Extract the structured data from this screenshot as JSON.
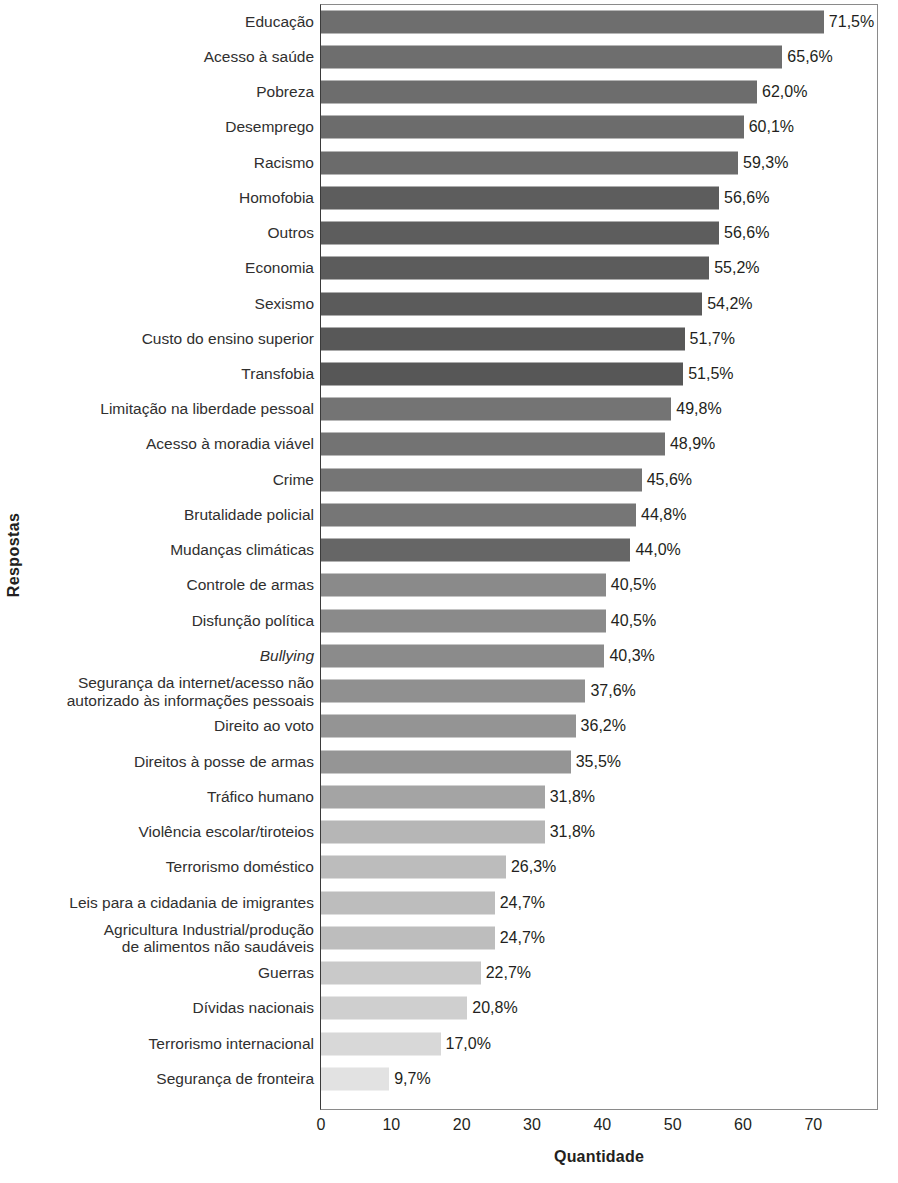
{
  "chart_data": {
    "type": "bar",
    "orientation": "horizontal",
    "title": "",
    "xlabel": "Quantidade",
    "ylabel": "Respostas",
    "xlim": [
      0,
      79.2
    ],
    "xticks": [
      0,
      10,
      20,
      30,
      40,
      50,
      60,
      70
    ],
    "grid": false,
    "legend": null,
    "value_suffix": "%",
    "decimal_separator": ",",
    "categories": [
      "Educação",
      "Acesso à saúde",
      "Pobreza",
      "Desemprego",
      "Racismo",
      "Homofobia",
      "Outros",
      "Economia",
      "Sexismo",
      "Custo do ensino superior",
      "Transfobia",
      "Limitação na liberdade pessoal",
      "Acesso à moradia viável",
      "Crime",
      "Brutalidade policial",
      "Mudanças climáticas",
      "Controle de armas",
      "Disfunção política",
      "Bullying",
      "Segurança da internet/acesso não\nautorizado às informações pessoais",
      "Direito ao voto",
      "Direitos à posse de armas",
      "Tráfico humano",
      "Violência escolar/tiroteios",
      "Terrorismo doméstico",
      "Leis para a cidadania de imigrantes",
      "Agricultura Industrial/produção\nde alimentos não saudáveis",
      "Guerras",
      "Dívidas nacionais",
      "Terrorismo internacional",
      "Segurança de fronteira"
    ],
    "values": [
      71.5,
      65.6,
      62.0,
      60.1,
      59.3,
      56.6,
      56.6,
      55.2,
      54.2,
      51.7,
      51.5,
      49.8,
      48.9,
      45.6,
      44.8,
      44.0,
      40.5,
      40.5,
      40.3,
      37.6,
      36.2,
      35.5,
      31.8,
      31.8,
      26.3,
      24.7,
      24.7,
      22.7,
      20.8,
      17.0,
      9.7
    ],
    "value_labels": [
      "71,5%",
      "65,6%",
      "62,0%",
      "60,1%",
      "59,3%",
      "56,6%",
      "56,6%",
      "55,2%",
      "54,2%",
      "51,7%",
      "51,5%",
      "49,8%",
      "48,9%",
      "45,6%",
      "44,8%",
      "44,0%",
      "40,5%",
      "40,5%",
      "40,3%",
      "37,6%",
      "36,2%",
      "35,5%",
      "31,8%",
      "31,8%",
      "26,3%",
      "24,7%",
      "24,7%",
      "22,7%",
      "20,8%",
      "17,0%",
      "9,7%"
    ],
    "bar_colors": [
      "#6e6e6e",
      "#6e6e6e",
      "#6d6d6d",
      "#6c6c6c",
      "#6b6b6b",
      "#5d5d5d",
      "#5d5d5d",
      "#5c5c5c",
      "#5b5b5b",
      "#585858",
      "#575757",
      "#747474",
      "#737373",
      "#757575",
      "#767676",
      "#666666",
      "#8a8a8a",
      "#8a8a8a",
      "#8b8b8b",
      "#909090",
      "#949494",
      "#959595",
      "#a4a4a4",
      "#b6b6b6",
      "#bcbcbc",
      "#bdbdbd",
      "#bdbdbd",
      "#c9c9c9",
      "#cfcfcf",
      "#d8d8d8",
      "#e2e2e2"
    ],
    "italic_categories": [
      "Bullying"
    ]
  },
  "axis": {
    "x_title": "Quantidade",
    "y_title": "Respostas",
    "x_tick_labels": [
      "0",
      "10",
      "20",
      "30",
      "40",
      "50",
      "60",
      "70"
    ]
  }
}
